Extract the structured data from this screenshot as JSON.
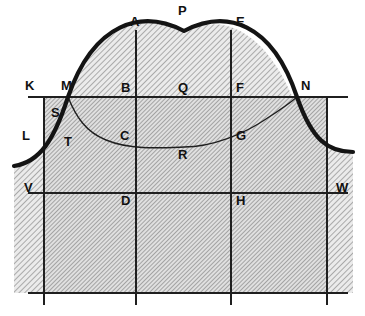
{
  "figure": {
    "background_color": "#ffffff",
    "line_color": "#1a1a1a",
    "hatch_color": "#8c8c8c",
    "fill_color": "#d9d9d9",
    "thick_curve_width": 4,
    "thin_line_width": 1.1
  },
  "labels": [
    {
      "id": "A",
      "text": "A",
      "x": 130,
      "y": 22,
      "name": "point-label-a"
    },
    {
      "id": "P",
      "text": "P",
      "x": 178,
      "y": 9,
      "name": "point-label-p"
    },
    {
      "id": "E",
      "text": "E",
      "x": 236,
      "y": 22,
      "name": "point-label-e"
    },
    {
      "id": "K",
      "text": "K",
      "x": 25,
      "y": 83,
      "name": "point-label-k"
    },
    {
      "id": "M",
      "text": "M",
      "x": 62,
      "y": 83,
      "name": "point-label-m"
    },
    {
      "id": "B",
      "text": "B",
      "x": 122,
      "y": 84,
      "name": "point-label-b"
    },
    {
      "id": "Q",
      "text": "Q",
      "x": 178,
      "y": 84,
      "name": "point-label-q"
    },
    {
      "id": "F",
      "text": "F",
      "x": 236,
      "y": 84,
      "name": "point-label-f"
    },
    {
      "id": "N",
      "text": "N",
      "x": 300,
      "y": 83,
      "name": "point-label-n"
    },
    {
      "id": "S",
      "text": "S",
      "x": 51,
      "y": 110,
      "name": "point-label-s"
    },
    {
      "id": "L",
      "text": "L",
      "x": 22,
      "y": 131,
      "name": "point-label-l"
    },
    {
      "id": "T",
      "text": "T",
      "x": 65,
      "y": 137,
      "name": "point-label-t"
    },
    {
      "id": "C",
      "text": "C",
      "x": 121,
      "y": 131,
      "name": "point-label-c"
    },
    {
      "id": "G",
      "text": "G",
      "x": 236,
      "y": 131,
      "name": "point-label-g"
    },
    {
      "id": "R",
      "text": "R",
      "x": 178,
      "y": 150,
      "name": "point-label-r"
    },
    {
      "id": "V",
      "text": "V",
      "x": 24,
      "y": 184,
      "name": "point-label-v"
    },
    {
      "id": "D",
      "text": "D",
      "x": 122,
      "y": 196,
      "name": "point-label-d"
    },
    {
      "id": "H",
      "text": "H",
      "x": 236,
      "y": 196,
      "name": "point-label-h"
    },
    {
      "id": "W",
      "text": "W",
      "x": 336,
      "y": 184,
      "name": "point-label-w"
    }
  ],
  "geometry": {
    "frame": {
      "left_x": 44,
      "right_x": 327,
      "top_y": 97,
      "bottom_y": 293
    },
    "inner_verticals": [
      136,
      231
    ],
    "horizontal_lines": [
      97,
      193,
      293
    ],
    "vw_line_y": 193,
    "kn_line_y": 97,
    "kn_line_x_start": 28,
    "kn_line_x_end": 348,
    "vw_line_x_start": 28,
    "vw_line_x_end": 348,
    "bottom_line_x_start": 28,
    "bottom_line_x_end": 348,
    "vertical_extent_top": 30,
    "vertical_extent_bottom": 305,
    "upper_curve": {
      "peak_x": 184,
      "peak_y": 31,
      "left_end_x": 14,
      "left_end_y": 166,
      "right_end_x": 353,
      "right_end_y": 152,
      "crosses_kn_at_x": [
        68,
        297
      ]
    },
    "lower_curve": {
      "valley_x": 184,
      "valley_y": 147,
      "left_end_x": 68,
      "left_end_y": 97,
      "right_end_x": 297,
      "right_end_y": 97
    }
  }
}
